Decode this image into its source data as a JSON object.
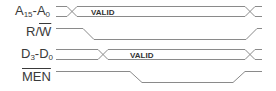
{
  "diagram": {
    "type": "timing-diagram",
    "line_color": "#8a8a8a",
    "text_color": "#3a3a3a",
    "signals": [
      {
        "name": "A15-A0",
        "base": "A",
        "sub1": "15",
        "sep": "-",
        "base2": "A",
        "sub2": "0",
        "kind": "bus",
        "bus_label": "VALID"
      },
      {
        "name": "R/W",
        "prefix": "R/",
        "overline": "W",
        "kind": "single",
        "behavior": "high-low-high"
      },
      {
        "name": "D3-D0",
        "base": "D",
        "sub1": "3",
        "sep": "-",
        "base2": "D",
        "sub2": "0",
        "kind": "bus",
        "bus_label": "VALID"
      },
      {
        "name": "MEN",
        "overline": "MEN",
        "kind": "single",
        "behavior": "high-low-high"
      }
    ]
  }
}
